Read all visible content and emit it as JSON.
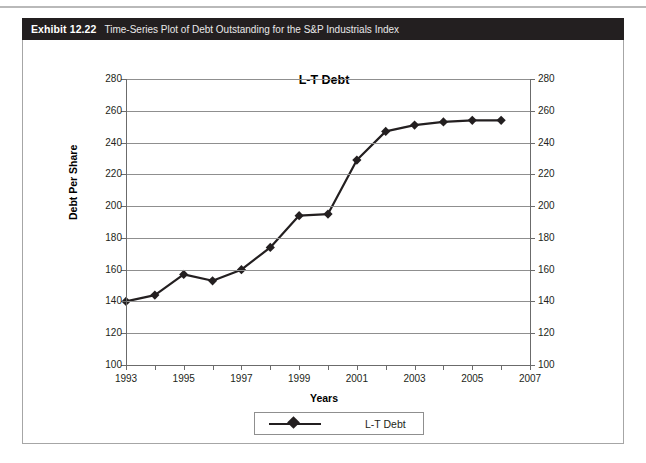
{
  "exhibit": {
    "label": "Exhibit 12.22",
    "caption": "Time-Series Plot of Debt Outstanding for the S&P Industrials Index"
  },
  "legend": {
    "entry": "L-T Debt",
    "position": "bottom-center"
  },
  "colors": {
    "header_bg": "#231f20",
    "header_text": "#ffffff",
    "series": "#231f20",
    "gridline": "#8f8f8f",
    "axis": "#6b6b6b",
    "plot_bg": "#ffffff"
  },
  "chart_data": {
    "type": "line",
    "title": "L-T Debt",
    "xlabel": "Years",
    "ylabel": "Debt Per Share",
    "xlim": [
      1993,
      2007
    ],
    "ylim": [
      100,
      280
    ],
    "ytick_step": 20,
    "xtick_step": 1,
    "grid": true,
    "yticks": [
      100,
      120,
      140,
      160,
      180,
      200,
      220,
      240,
      260,
      280
    ],
    "yticks_right": [
      100,
      120,
      140,
      160,
      180,
      200,
      220,
      240,
      260,
      280
    ],
    "xticks": [
      1993,
      1994,
      1995,
      1996,
      1997,
      1998,
      1999,
      2000,
      2001,
      2002,
      2003,
      2004,
      2005,
      2006,
      2007
    ],
    "xtick_labels": [
      "1993",
      "",
      "1995",
      "",
      "1997",
      "",
      "1999",
      "",
      "2001",
      "",
      "2003",
      "",
      "2005",
      "",
      "2007"
    ],
    "marker": "diamond",
    "series": [
      {
        "name": "L-T Debt",
        "x": [
          1993,
          1994,
          1995,
          1996,
          1997,
          1998,
          1999,
          2000,
          2001,
          2002,
          2003,
          2004,
          2005,
          2006
        ],
        "values": [
          140,
          144,
          157,
          153,
          160,
          174,
          194,
          195,
          229,
          247,
          251,
          253,
          254,
          254
        ]
      }
    ]
  }
}
